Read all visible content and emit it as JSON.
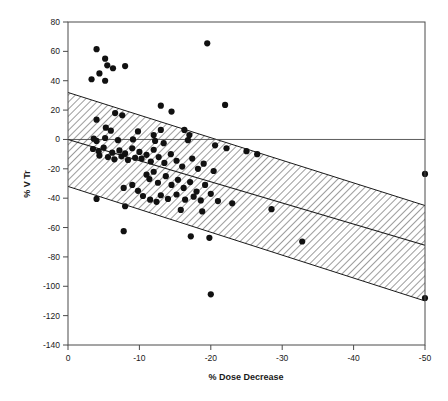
{
  "chart_data": {
    "type": "scatter",
    "title": "",
    "xlabel": "% Dose Decrease",
    "ylabel": "% V Tr",
    "xlim": [
      0,
      -50
    ],
    "ylim": [
      -140,
      80
    ],
    "x_ticks": [
      0,
      -10,
      -20,
      -30,
      -40,
      -50
    ],
    "x_tick_labels": [
      "0",
      "-10",
      "-20",
      "-30",
      "-40",
      "-50"
    ],
    "y_ticks": [
      80,
      60,
      40,
      20,
      0,
      -20,
      -40,
      -60,
      -80,
      -100,
      -120,
      -140
    ],
    "y_tick_labels": [
      "80",
      "60",
      "40",
      "20",
      "0",
      "-20",
      "-40",
      "-60",
      "-80",
      "-100",
      "-120",
      "-140"
    ],
    "grid": false,
    "legend": null,
    "x_axis_reversed": true,
    "reference_line": {
      "name": "zero-line",
      "y": 0,
      "from_x": 0,
      "to_x": -50
    },
    "regression_line": {
      "name": "regression-fit",
      "points": [
        [
          0,
          0
        ],
        [
          -50,
          -72
        ]
      ]
    },
    "confidence_band": {
      "name": "prediction-band",
      "hatch": "diagonal",
      "upper": [
        [
          0,
          32
        ],
        [
          -50,
          -45
        ]
      ],
      "lower": [
        [
          0,
          -32
        ],
        [
          -50,
          -110
        ]
      ]
    },
    "marker": {
      "shape": "circle",
      "color": "#111111",
      "size": 3.1
    },
    "points": [
      [
        -4.0,
        61.5
      ],
      [
        -5.2,
        55.0
      ],
      [
        -5.5,
        50.5
      ],
      [
        -6.3,
        48.5
      ],
      [
        -8.0,
        50.0
      ],
      [
        -3.3,
        41.0
      ],
      [
        -4.4,
        45.0
      ],
      [
        -5.2,
        40.0
      ],
      [
        -19.5,
        65.5
      ],
      [
        -13.0,
        23.0
      ],
      [
        -14.5,
        19.0
      ],
      [
        -22.0,
        23.5
      ],
      [
        -4.0,
        13.5
      ],
      [
        -6.6,
        18.0
      ],
      [
        -7.6,
        16.5
      ],
      [
        -5.3,
        8.0
      ],
      [
        -6.0,
        6.0
      ],
      [
        -9.8,
        5.5
      ],
      [
        -12.0,
        3.0
      ],
      [
        -13.0,
        6.5
      ],
      [
        -16.3,
        6.5
      ],
      [
        -17.0,
        3.0
      ],
      [
        -3.6,
        0.5
      ],
      [
        -4.0,
        -1.0
      ],
      [
        -5.2,
        1.0
      ],
      [
        -7.0,
        -0.5
      ],
      [
        -9.1,
        0.0
      ],
      [
        -12.2,
        -1.0
      ],
      [
        -13.4,
        -2.5
      ],
      [
        -16.8,
        -0.5
      ],
      [
        -20.6,
        -4.0
      ],
      [
        -22.2,
        -6.0
      ],
      [
        -25.0,
        -8.0
      ],
      [
        -26.5,
        -10.0
      ],
      [
        -3.5,
        -6.5
      ],
      [
        -4.3,
        -8.0
      ],
      [
        -4.4,
        -11.0
      ],
      [
        -5.0,
        -5.5
      ],
      [
        -5.6,
        -12.0
      ],
      [
        -6.2,
        -9.0
      ],
      [
        -6.5,
        -13.5
      ],
      [
        -7.2,
        -7.5
      ],
      [
        -7.5,
        -11.5
      ],
      [
        -8.0,
        -9.5
      ],
      [
        -8.4,
        -14.0
      ],
      [
        -9.0,
        -6.0
      ],
      [
        -9.4,
        -12.5
      ],
      [
        -10.0,
        -8.5
      ],
      [
        -10.3,
        -13.0
      ],
      [
        -11.0,
        -10.5
      ],
      [
        -11.6,
        -15.0
      ],
      [
        -12.0,
        -7.0
      ],
      [
        -12.7,
        -12.0
      ],
      [
        -13.5,
        -16.0
      ],
      [
        -14.4,
        -10.0
      ],
      [
        -15.2,
        -14.5
      ],
      [
        -16.0,
        -18.5
      ],
      [
        -17.4,
        -13.0
      ],
      [
        -18.2,
        -20.0
      ],
      [
        -19.0,
        -16.5
      ],
      [
        -20.4,
        -21.5
      ],
      [
        -11.0,
        -24.0
      ],
      [
        -11.4,
        -27.0
      ],
      [
        -12.0,
        -22.0
      ],
      [
        -12.6,
        -29.5
      ],
      [
        -13.7,
        -25.0
      ],
      [
        -14.5,
        -31.0
      ],
      [
        -15.4,
        -27.5
      ],
      [
        -16.2,
        -33.0
      ],
      [
        -17.1,
        -29.0
      ],
      [
        -18.0,
        -35.5
      ],
      [
        -19.2,
        -31.0
      ],
      [
        -20.0,
        -37.0
      ],
      [
        -9.0,
        -31.0
      ],
      [
        -9.8,
        -35.0
      ],
      [
        -10.5,
        -38.5
      ],
      [
        -7.8,
        -33.0
      ],
      [
        -13.0,
        -38.0
      ],
      [
        -14.0,
        -40.5
      ],
      [
        -15.2,
        -37.5
      ],
      [
        -16.4,
        -41.0
      ],
      [
        -17.6,
        -39.0
      ],
      [
        -18.6,
        -41.5
      ],
      [
        -11.5,
        -41.0
      ],
      [
        -12.4,
        -42.5
      ],
      [
        -4.0,
        -40.5
      ],
      [
        -8.0,
        -45.5
      ],
      [
        -21.0,
        -42.0
      ],
      [
        -23.0,
        -43.5
      ],
      [
        -28.5,
        -47.5
      ],
      [
        -15.8,
        -48.0
      ],
      [
        -18.8,
        -49.0
      ],
      [
        -17.2,
        -66.0
      ],
      [
        -19.8,
        -67.0
      ],
      [
        -7.8,
        -62.5
      ],
      [
        -20.0,
        -105.5
      ],
      [
        -50.0,
        -108.0
      ],
      [
        -32.8,
        -69.5
      ],
      [
        -50.0,
        -23.5
      ]
    ]
  }
}
